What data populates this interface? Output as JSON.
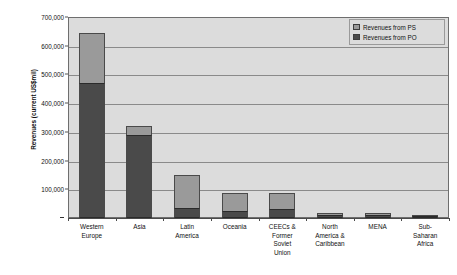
{
  "chart_data": {
    "type": "bar",
    "stacked": true,
    "title": "",
    "xlabel": "",
    "ylabel": "Revenues (current US$mil)",
    "ylim": [
      0,
      700000
    ],
    "grid": true,
    "legend_position": "top-right-inside",
    "y_ticks": [
      {
        "value": 700000,
        "label": "700,000"
      },
      {
        "value": 600000,
        "label": "600,000"
      },
      {
        "value": 500000,
        "label": "500,000"
      },
      {
        "value": 400000,
        "label": "400,000"
      },
      {
        "value": 300000,
        "label": "300,000"
      },
      {
        "value": 200000,
        "label": "200,000"
      },
      {
        "value": 100000,
        "label": "100,000"
      },
      {
        "value": 0,
        "label": "-"
      }
    ],
    "categories": [
      "Western Europe",
      "Asia",
      "Latin America",
      "Oceania",
      "CEECs & Former Soviet Union",
      "North America & Caribbean",
      "MENA",
      "Sub-Saharan Africa"
    ],
    "category_label_lines": [
      [
        "Western",
        "Europe"
      ],
      [
        "Asia"
      ],
      [
        "Latin",
        "America"
      ],
      [
        "Oceania"
      ],
      [
        "CEECs &",
        "Former",
        "Soviet",
        "Union"
      ],
      [
        "North",
        "America &",
        "Caribbean"
      ],
      [
        "MENA"
      ],
      [
        "Sub-",
        "Saharan",
        "Africa"
      ]
    ],
    "series": [
      {
        "name": "Revenues from PO",
        "color": "#4a4a4a",
        "values": [
          470000,
          290000,
          35000,
          25000,
          30000,
          12000,
          11000,
          4000
        ]
      },
      {
        "name": "Revenues from PS",
        "color": "#9a9a9a",
        "values": [
          175000,
          30000,
          115000,
          62000,
          58000,
          5000,
          5000,
          1000
        ]
      }
    ],
    "totals": [
      645000,
      320000,
      150000,
      87000,
      88000,
      17000,
      16000,
      5000
    ]
  },
  "legend": {
    "items": [
      {
        "label": "Revenues from PS",
        "color": "#9a9a9a"
      },
      {
        "label": "Revenues from PO",
        "color": "#4a4a4a"
      }
    ]
  },
  "colors": {
    "plot_background": "#dcdcdc",
    "gridline": "#8a8a8a",
    "frame": "#6e6e6e",
    "series_ps": "#9a9a9a",
    "series_po": "#4a4a4a",
    "page_background": "#ffffff"
  }
}
